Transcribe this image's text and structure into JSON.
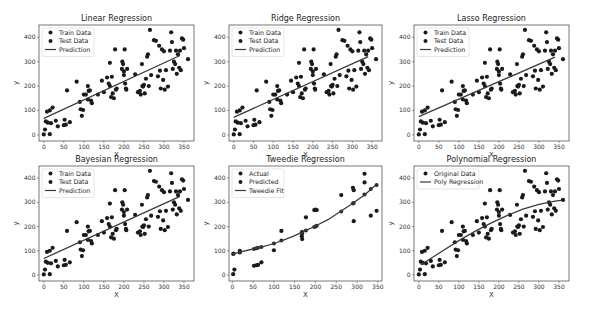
{
  "chart_data": [
    {
      "type": "scatter",
      "title": "Linear Regression",
      "xlabel": "X",
      "ylabel": "y",
      "xlim": [
        -12,
        375
      ],
      "ylim": [
        -25,
        450
      ],
      "xticks": [
        0,
        50,
        100,
        150,
        200,
        250,
        300,
        350
      ],
      "yticks": [
        0,
        100,
        200,
        300,
        400
      ],
      "legend": [
        "Train Data",
        "Test Data",
        "Prediction"
      ],
      "legend_position": "upper left",
      "box": {
        "x": 39,
        "y": 25,
        "w": 155,
        "h": 116
      },
      "line": {
        "kind": "linear",
        "x": [
          0,
          340
        ],
        "y": [
          68,
          325
        ]
      },
      "series_ref": "shared_points"
    },
    {
      "type": "scatter",
      "title": "Ridge Regression",
      "xlabel": "X",
      "ylabel": "y",
      "xlim": [
        -12,
        375
      ],
      "ylim": [
        -25,
        450
      ],
      "xticks": [
        0,
        50,
        100,
        150,
        200,
        250,
        300,
        350
      ],
      "yticks": [
        0,
        100,
        200,
        300,
        400
      ],
      "legend": [
        "Train Data",
        "Test Data",
        "Prediction"
      ],
      "legend_position": "upper left",
      "box": {
        "x": 229,
        "y": 25,
        "w": 153,
        "h": 116
      },
      "line": {
        "kind": "linear",
        "x": [
          0,
          340
        ],
        "y": [
          72,
          320
        ]
      },
      "series_ref": "shared_points"
    },
    {
      "type": "scatter",
      "title": "Lasso Regression",
      "xlabel": "X",
      "ylabel": "y",
      "xlim": [
        -12,
        375
      ],
      "ylim": [
        -25,
        450
      ],
      "xticks": [
        0,
        50,
        100,
        150,
        200,
        250,
        300,
        350
      ],
      "yticks": [
        0,
        100,
        200,
        300,
        400
      ],
      "legend": [
        "Train Data",
        "Test Data",
        "Prediction"
      ],
      "legend_position": "upper left",
      "box": {
        "x": 414,
        "y": 25,
        "w": 155,
        "h": 116
      },
      "line": {
        "kind": "linear",
        "x": [
          0,
          340
        ],
        "y": [
          75,
          318
        ]
      },
      "series_ref": "shared_points"
    },
    {
      "type": "scatter",
      "title": "Bayesian Regression",
      "xlabel": "X",
      "ylabel": "y",
      "xlim": [
        -12,
        375
      ],
      "ylim": [
        -25,
        450
      ],
      "xticks": [
        0,
        50,
        100,
        150,
        200,
        250,
        300,
        350
      ],
      "yticks": [
        0,
        100,
        200,
        300,
        400
      ],
      "legend": [
        "Train Data",
        "Test Data",
        "Prediction"
      ],
      "legend_position": "upper left",
      "box": {
        "x": 39,
        "y": 166,
        "w": 155,
        "h": 115
      },
      "line": {
        "kind": "linear",
        "x": [
          0,
          340
        ],
        "y": [
          68,
          325
        ]
      },
      "series_ref": "shared_points"
    },
    {
      "type": "scatter",
      "title": "Tweedie Regression",
      "xlabel": "X",
      "ylabel": "y",
      "xlim": [
        -8,
        360
      ],
      "ylim": [
        -25,
        450
      ],
      "xticks": [
        0,
        50,
        100,
        150,
        200,
        250,
        300,
        350
      ],
      "yticks": [
        0,
        100,
        200,
        300,
        400
      ],
      "legend": [
        "Actual",
        "Predicted",
        "Tweedie Fit"
      ],
      "legend_position": "upper left",
      "box": {
        "x": 229,
        "y": 166,
        "w": 153,
        "h": 115
      },
      "line": {
        "kind": "curve",
        "x": [
          2,
          20,
          50,
          70,
          100,
          120,
          150,
          170,
          180,
          200,
          230,
          260,
          290,
          320,
          345
        ],
        "y": [
          87,
          95,
          107,
          115,
          130,
          142,
          162,
          178,
          186,
          202,
          228,
          262,
          296,
          333,
          372
        ]
      },
      "points_actual": {
        "x": [
          2,
          5,
          3,
          18,
          18,
          52,
          58,
          62,
          70,
          100,
          118,
          167,
          168,
          168,
          177,
          197,
          200,
          203,
          262,
          290,
          292,
          292,
          318,
          318,
          333,
          347
        ],
        "y": [
          3,
          22,
          88,
          100,
          93,
          38,
          40,
          42,
          52,
          102,
          182,
          160,
          148,
          172,
          238,
          268,
          270,
          268,
          330,
          360,
          350,
          222,
          418,
          382,
          245,
          265
        ]
      },
      "points_predicted": {
        "x": [
          2,
          18,
          52,
          58,
          62,
          70,
          100,
          118,
          167,
          168,
          177,
          197,
          200,
          203,
          262,
          290,
          292,
          318,
          333,
          347
        ],
        "y": [
          87,
          95,
          107,
          110,
          112,
          115,
          130,
          142,
          175,
          178,
          184,
          198,
          200,
          203,
          262,
          295,
          297,
          332,
          355,
          372
        ]
      }
    },
    {
      "type": "scatter",
      "title": "Polynomial Regression",
      "xlabel": "X",
      "ylabel": "y",
      "xlim": [
        -12,
        375
      ],
      "ylim": [
        -25,
        450
      ],
      "xticks": [
        0,
        50,
        100,
        150,
        200,
        250,
        300,
        350
      ],
      "yticks": [
        0,
        100,
        200,
        300,
        400
      ],
      "legend": [
        "Original Data",
        "Poly Regression"
      ],
      "legend_position": "upper left",
      "box": {
        "x": 414,
        "y": 166,
        "w": 155,
        "h": 115
      },
      "line": {
        "kind": "curve",
        "x": [
          5,
          30,
          60,
          100,
          140,
          180,
          220,
          260,
          300,
          340,
          355
        ],
        "y": [
          42,
          68,
          100,
          142,
          180,
          214,
          245,
          272,
          292,
          305,
          308
        ]
      },
      "series_ref": "shared_points"
    }
  ],
  "shared_points": {
    "x": [
      0,
      3,
      5,
      8,
      10,
      15,
      15,
      18,
      22,
      30,
      35,
      50,
      52,
      55,
      58,
      65,
      82,
      90,
      92,
      95,
      98,
      100,
      105,
      110,
      110,
      112,
      115,
      118,
      120,
      135,
      145,
      150,
      158,
      162,
      165,
      165,
      168,
      170,
      172,
      175,
      178,
      180,
      182,
      195,
      196,
      198,
      200,
      200,
      202,
      203,
      205,
      206,
      208,
      228,
      235,
      240,
      242,
      245,
      246,
      248,
      250,
      252,
      255,
      258,
      260,
      262,
      265,
      268,
      275,
      280,
      285,
      288,
      290,
      292,
      295,
      298,
      300,
      302,
      305,
      310,
      315,
      318,
      320,
      322,
      325,
      328,
      330,
      332,
      335,
      338,
      340,
      342,
      345,
      348,
      350,
      360
    ],
    "y": [
      2,
      22,
      55,
      95,
      50,
      100,
      3,
      48,
      112,
      58,
      35,
      40,
      62,
      42,
      182,
      52,
      218,
      135,
      105,
      78,
      102,
      165,
      165,
      145,
      200,
      180,
      182,
      140,
      130,
      165,
      222,
      175,
      235,
      210,
      200,
      295,
      155,
      238,
      170,
      150,
      350,
      185,
      190,
      270,
      300,
      290,
      260,
      245,
      350,
      210,
      190,
      185,
      270,
      248,
      175,
      180,
      165,
      290,
      200,
      198,
      205,
      170,
      230,
      320,
      330,
      200,
      430,
      245,
      388,
      385,
      240,
      365,
      263,
      190,
      350,
      225,
      342,
      185,
      265,
      198,
      345,
      420,
      380,
      270,
      300,
      290,
      345,
      250,
      330,
      275,
      345,
      265,
      395,
      390,
      355,
      310
    ]
  },
  "colors": {
    "point": "#1a1a1a",
    "line": "#3a3a3a",
    "axis": "#555555"
  }
}
